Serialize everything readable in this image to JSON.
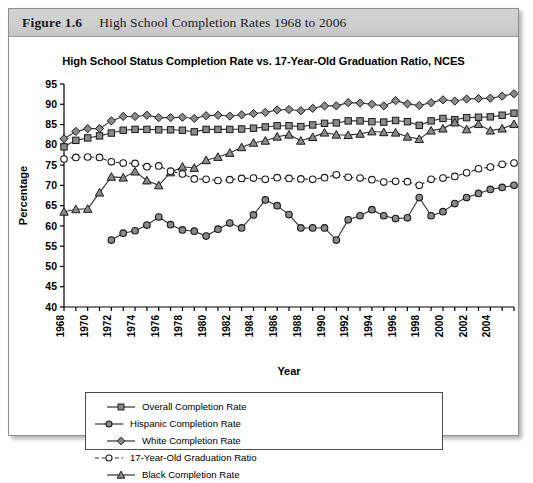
{
  "figure": {
    "number": "Figure 1.6",
    "caption": "High School Completion Rates 1968 to 2006"
  },
  "chart_data": {
    "type": "line",
    "title": "High School Status Completion Rate vs. 17-Year-Old Graduation Ratio, NCES",
    "xlabel": "Year",
    "ylabel": "Percentage",
    "ylim": [
      40,
      95
    ],
    "yticks": [
      40,
      45,
      50,
      55,
      60,
      65,
      70,
      75,
      80,
      85,
      90,
      95
    ],
    "xlim": [
      1968,
      2006
    ],
    "xticks": [
      1968,
      1969,
      1970,
      1971,
      1972,
      1973,
      1974,
      1975,
      1976,
      1977,
      1978,
      1979,
      1980,
      1981,
      1982,
      1983,
      1984,
      1985,
      1986,
      1987,
      1988,
      1989,
      1990,
      1991,
      1992,
      1993,
      1994,
      1995,
      1996,
      1997,
      1998,
      1999,
      2000,
      2001,
      2002,
      2003,
      2004,
      2005,
      2006
    ],
    "xticklabels": [
      "1968",
      "",
      "1970",
      "",
      "1972",
      "",
      "1974",
      "",
      "1976",
      "",
      "1978",
      "",
      "1980",
      "",
      "1982",
      "",
      "1984",
      "",
      "1986",
      "",
      "1988",
      "",
      "1990",
      "",
      "1992",
      "",
      "1994",
      "",
      "1996",
      "",
      "1998",
      "",
      "2000",
      "",
      "2002",
      "",
      "2004",
      "",
      ""
    ],
    "grid": false,
    "legend_position": "bottom",
    "x": [
      1968,
      1969,
      1970,
      1971,
      1972,
      1973,
      1974,
      1975,
      1976,
      1977,
      1978,
      1979,
      1980,
      1981,
      1982,
      1983,
      1984,
      1985,
      1986,
      1987,
      1988,
      1989,
      1990,
      1991,
      1992,
      1993,
      1994,
      1995,
      1996,
      1997,
      1998,
      1999,
      2000,
      2001,
      2002,
      2003,
      2004,
      2005,
      2006
    ],
    "series": [
      {
        "name": "Overall Completion Rate",
        "marker": "square",
        "linestyle": "solid",
        "values": [
          79.5,
          81.1,
          81.7,
          82.2,
          82.9,
          83.6,
          83.8,
          83.8,
          83.7,
          83.7,
          83.6,
          83.2,
          83.8,
          83.8,
          83.8,
          83.9,
          84.1,
          84.4,
          84.7,
          84.7,
          84.5,
          84.9,
          85.3,
          85.4,
          85.9,
          85.9,
          85.7,
          85.6,
          86.0,
          85.7,
          84.8,
          85.9,
          86.5,
          86.2,
          86.7,
          86.8,
          86.9,
          87.3,
          87.8
        ]
      },
      {
        "name": "White Completion Rate",
        "marker": "diamond",
        "linestyle": "solid",
        "values": [
          81.5,
          83.3,
          84.0,
          84.0,
          85.9,
          87.0,
          87.0,
          87.3,
          86.7,
          86.7,
          86.8,
          86.5,
          87.2,
          87.3,
          87.1,
          87.4,
          87.7,
          88.0,
          88.6,
          88.7,
          88.4,
          89.0,
          89.6,
          89.6,
          90.4,
          90.3,
          90.0,
          89.6,
          90.9,
          90.1,
          89.7,
          90.4,
          91.1,
          90.8,
          91.3,
          91.4,
          91.5,
          92.0,
          92.6
        ]
      },
      {
        "name": "Black Completion Rate",
        "marker": "triangle",
        "linestyle": "solid",
        "values": [
          63.5,
          64.1,
          64.2,
          68.2,
          72.1,
          71.9,
          73.4,
          71.2,
          70.0,
          73.2,
          74.6,
          74.3,
          76.2,
          77.0,
          78.0,
          79.4,
          80.5,
          81.0,
          82.0,
          82.5,
          81.0,
          81.9,
          83.0,
          82.5,
          82.4,
          82.7,
          83.3,
          83.1,
          83.0,
          82.0,
          81.4,
          83.5,
          84.0,
          85.5,
          83.8,
          85.1,
          83.5,
          84.0,
          85.1
        ]
      },
      {
        "name": "Hispanic Completion Rate",
        "marker": "circle-filled",
        "linestyle": "solid",
        "values": [
          null,
          null,
          null,
          null,
          56.5,
          58.2,
          58.8,
          60.2,
          62.2,
          60.3,
          59.0,
          58.7,
          57.5,
          59.2,
          60.7,
          59.5,
          62.7,
          66.4,
          65.0,
          62.8,
          59.5,
          59.5,
          59.5,
          56.5,
          61.5,
          62.5,
          64.0,
          62.5,
          61.8,
          62.0,
          67.0,
          62.5,
          63.5,
          65.5,
          67.0,
          68.0,
          69.0,
          69.5,
          70.0
        ]
      },
      {
        "name": "17-Year-Old Graduation Ratio",
        "marker": "circle-open",
        "linestyle": "dashed",
        "values": [
          76.5,
          76.9,
          77.0,
          76.9,
          75.8,
          75.5,
          75.4,
          74.6,
          74.8,
          73.5,
          72.8,
          71.6,
          71.5,
          71.2,
          71.4,
          71.7,
          71.8,
          71.5,
          71.9,
          71.7,
          71.6,
          71.5,
          71.9,
          72.6,
          72.0,
          71.8,
          71.4,
          70.8,
          71.0,
          70.9,
          70.0,
          71.5,
          71.8,
          72.2,
          73.1,
          74.1,
          74.5,
          75.2,
          75.5
        ]
      }
    ]
  },
  "legend": {
    "items": [
      {
        "label": "Overall Completion Rate",
        "marker": "square",
        "linestyle": "solid"
      },
      {
        "label": "Hispanic Completion Rate",
        "marker": "circle-filled",
        "linestyle": "solid"
      },
      {
        "label": "White Completion Rate",
        "marker": "diamond",
        "linestyle": "solid"
      },
      {
        "label": "17-Year-Old Graduation Ratio",
        "marker": "circle-open",
        "linestyle": "dashed"
      },
      {
        "label": "Black Completion Rate",
        "marker": "triangle",
        "linestyle": "solid"
      }
    ]
  },
  "colors": {
    "line": "#333333",
    "marker_fill": "#8a8a8a",
    "marker_fill_open": "#ffffff",
    "axis": "#000000",
    "header_bg": "#cfcfcf"
  }
}
